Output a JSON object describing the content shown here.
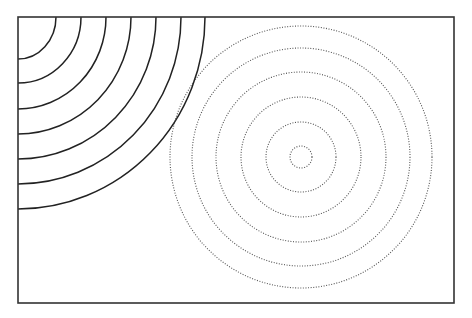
{
  "figure": {
    "colors": {
      "background": "#ffffff",
      "frame": "#333333",
      "solid_arcs": "#222222",
      "dotted_circles": "#555555"
    },
    "frame": {
      "x": 18,
      "y": 17,
      "width": 436,
      "height": 286
    },
    "solid_arcs": {
      "style": "solid",
      "center": [
        18,
        17
      ],
      "rx": [
        38,
        63,
        88,
        113,
        138,
        163,
        187
      ],
      "ry": [
        42,
        66,
        92,
        117,
        142,
        167,
        192
      ]
    },
    "dotted_circles": {
      "style": "dotted",
      "center": [
        301,
        157
      ],
      "radii": [
        11,
        35,
        60,
        85,
        109,
        131
      ]
    }
  }
}
